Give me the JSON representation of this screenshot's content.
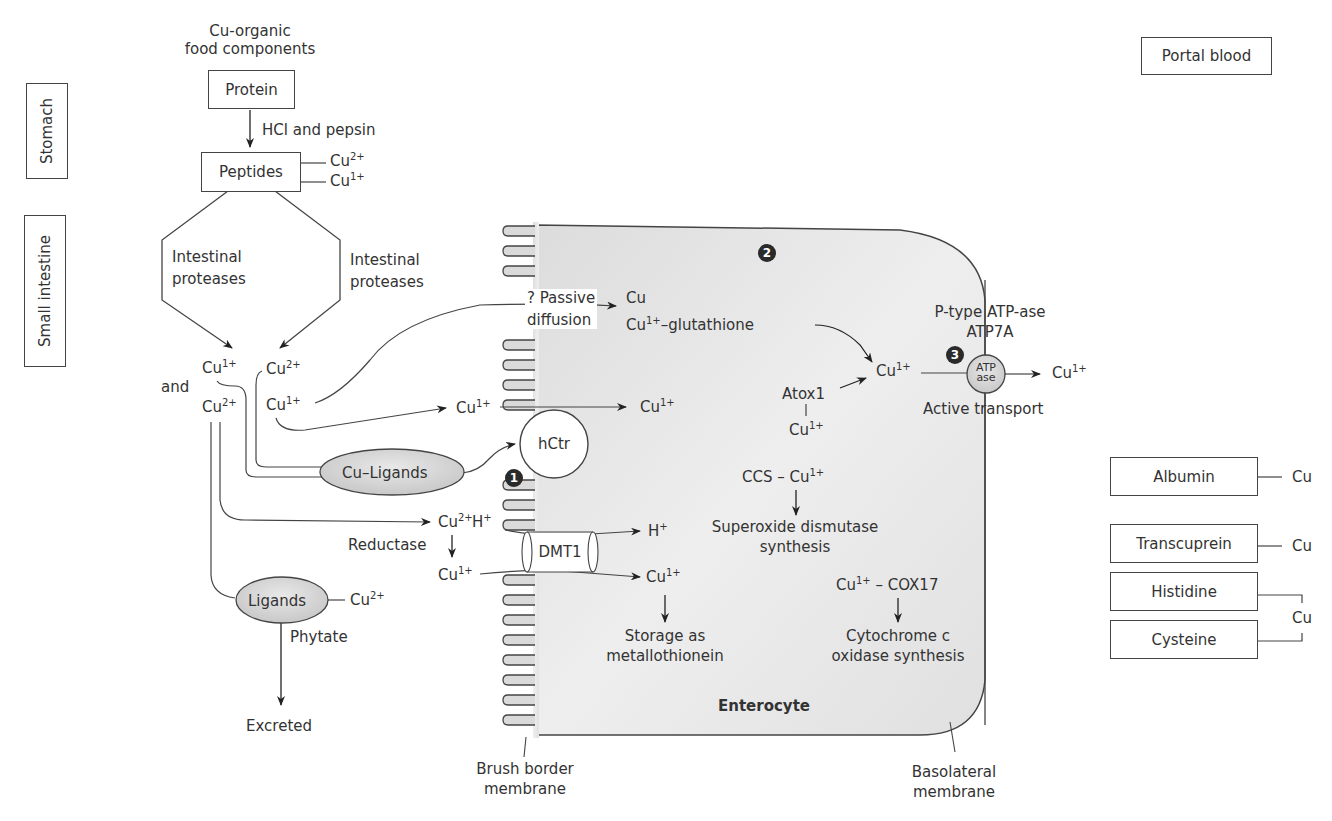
{
  "regions": {
    "stomach": "Stomach",
    "small_intestine": "Small intestine",
    "portal_blood": "Portal blood"
  },
  "food": {
    "source_line1": "Cu-organic",
    "source_line2": "food components",
    "protein": "Protein",
    "digestion_step": "HCl and pepsin",
    "peptides": "Peptides",
    "peptide_cu_a": "Cu",
    "peptide_cu_a_charge": "2+",
    "peptide_cu_b": "Cu",
    "peptide_cu_b_charge": "1+",
    "protease_left_1": "Intestinal",
    "protease_left_2": "proteases",
    "protease_right_1": "Intestinal",
    "protease_right_2": "proteases"
  },
  "lumen": {
    "and": "and",
    "cu": "Cu",
    "c1": "1+",
    "c2": "2+",
    "cu_ligands": "Cu–Ligands",
    "ligands": "Ligands",
    "phytate": "Phytate",
    "excreted": "Excreted",
    "reductase": "Reductase",
    "h": "H",
    "plus": "+",
    "passive_1": "? Passive",
    "passive_2": "diffusion"
  },
  "transporters": {
    "hctr": "hCtr",
    "dmt1": "DMT1",
    "atpase_1": "ATP",
    "atpase_2": "ase",
    "atpase_label_1": "P-type ATP-ase",
    "atpase_label_2": "ATP7A",
    "active_transport": "Active transport"
  },
  "cell": {
    "name": "Enterocyte",
    "glutathione": "–glutathione",
    "atox1": "Atox1",
    "ccs": "CCS – ",
    "sod_1": "Superoxide dismutase",
    "sod_2": "synthesis",
    "cox17": " – COX17",
    "cox_1": "Cytochrome c",
    "cox_2": "oxidase synthesis",
    "storage_1": "Storage as",
    "storage_2": "metallothionein"
  },
  "membranes": {
    "brush_1": "Brush border",
    "brush_2": "membrane",
    "baso_1": "Basolateral",
    "baso_2": "membrane"
  },
  "badges": [
    "1",
    "2",
    "3"
  ],
  "blood": {
    "albumin": "Albumin",
    "transcuprein": "Transcuprein",
    "histidine": "Histidine",
    "cysteine": "Cysteine",
    "cu": "Cu"
  }
}
